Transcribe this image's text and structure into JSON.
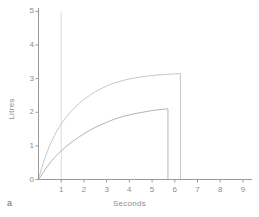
{
  "panel": {
    "label": "a"
  },
  "colors": {
    "axis": "#9a9a9a",
    "curve_upper": "#c8c8c8",
    "curve_lower": "#b4b4b4",
    "gridline": "#dcdcdc",
    "text": "#8d8d8d",
    "background": "#ffffff"
  },
  "chart_data": {
    "type": "line",
    "title": "",
    "xlabel": "Seconds",
    "ylabel": "Litres",
    "xlim": [
      0,
      9.4
    ],
    "ylim": [
      0,
      5.1
    ],
    "xticks": [
      1,
      2,
      3,
      4,
      5,
      6,
      7,
      8,
      9
    ],
    "xtick_labels": [
      "1",
      "2",
      "3",
      "4",
      "5",
      "6",
      "7",
      "8",
      "9"
    ],
    "yticks": [
      0,
      1,
      2,
      3,
      4,
      5
    ],
    "ytick_labels": [
      "0",
      "1",
      "2",
      "3",
      "4",
      "5"
    ],
    "grid": false,
    "legend": "none",
    "annotations": [
      {
        "name": "one-second-marker",
        "type": "vline",
        "x": 1.0,
        "y_from": 0,
        "y_to": 5.0,
        "label": ""
      }
    ],
    "series": [
      {
        "name": "Upper expiratory volume curve",
        "color": "#c8c8c8",
        "end_x": 6.25,
        "plateau": 3.15,
        "value_at_1s": 1.65,
        "drop_to_zero_at_end": true,
        "x": [
          0,
          0.1,
          0.2,
          0.3,
          0.4,
          0.5,
          0.6,
          0.7,
          0.8,
          0.9,
          1.0,
          1.2,
          1.4,
          1.6,
          1.8,
          2.0,
          2.25,
          2.5,
          2.75,
          3.0,
          3.25,
          3.5,
          3.75,
          4.0,
          4.25,
          4.5,
          4.75,
          5.0,
          5.25,
          5.5,
          5.75,
          6.0,
          6.25
        ],
        "y": [
          0,
          0.25,
          0.47,
          0.67,
          0.85,
          1.02,
          1.17,
          1.3,
          1.43,
          1.55,
          1.65,
          1.84,
          2.0,
          2.14,
          2.27,
          2.38,
          2.5,
          2.61,
          2.7,
          2.78,
          2.85,
          2.9,
          2.95,
          2.99,
          3.02,
          3.05,
          3.07,
          3.09,
          3.11,
          3.12,
          3.13,
          3.14,
          3.15
        ]
      },
      {
        "name": "Lower expiratory volume curve",
        "color": "#b4b4b4",
        "end_x": 5.7,
        "plateau": 2.1,
        "value_at_1s": 0.85,
        "drop_to_zero_at_end": true,
        "x": [
          0,
          0.1,
          0.2,
          0.3,
          0.4,
          0.5,
          0.6,
          0.7,
          0.8,
          0.9,
          1.0,
          1.25,
          1.5,
          1.75,
          2.0,
          2.25,
          2.5,
          2.75,
          3.0,
          3.25,
          3.5,
          3.75,
          4.0,
          4.25,
          4.5,
          4.75,
          5.0,
          5.25,
          5.5,
          5.7
        ],
        "y": [
          0,
          0.1,
          0.2,
          0.3,
          0.4,
          0.49,
          0.57,
          0.65,
          0.72,
          0.79,
          0.85,
          1.0,
          1.13,
          1.25,
          1.36,
          1.46,
          1.55,
          1.63,
          1.7,
          1.77,
          1.83,
          1.88,
          1.92,
          1.96,
          1.99,
          2.02,
          2.05,
          2.07,
          2.09,
          2.1
        ]
      }
    ]
  }
}
